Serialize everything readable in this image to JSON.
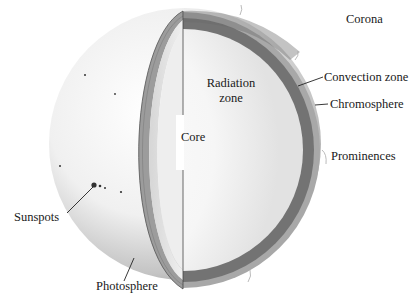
{
  "diagram": {
    "colors": {
      "background": "#ffffff",
      "surface_light": "#f4f4f4",
      "surface_shade": "#9a9a9a",
      "convection_band": "#6f6f6f",
      "chromosphere_band": "#a8a8a8",
      "interior": "#fbfbfb",
      "label_text": "#1a1a1a",
      "leader_line": "#222222"
    },
    "labels": {
      "corona": "Corona",
      "convection_zone": "Convection zone",
      "chromosphere": "Chromosphere",
      "prominences": "Prominences",
      "radiation_zone_line1": "Radiation",
      "radiation_zone_line2": "zone",
      "core": "Core",
      "sunspots": "Sunspots",
      "photosphere": "Photosphere"
    }
  }
}
